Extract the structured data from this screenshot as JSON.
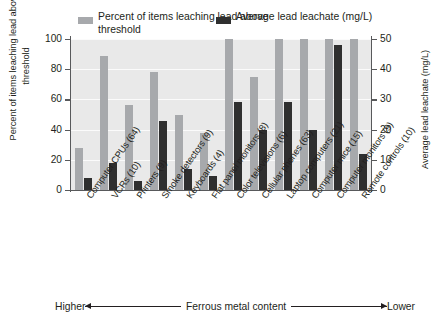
{
  "chart_data": {
    "type": "bar",
    "title": "",
    "subtitle": "",
    "xlabel": "Ferrous metal content",
    "ylabel": "Percent of items leaching lead above threshold",
    "ylabel_secondary": "Average lead leachate (mg/L)",
    "grid": true,
    "legend_position": "top",
    "ylim": [
      0,
      100
    ],
    "ylim_secondary": [
      0,
      50
    ],
    "yticks": [
      0,
      20,
      40,
      60,
      80,
      100
    ],
    "yticks_secondary": [
      0,
      10,
      20,
      30,
      40,
      50
    ],
    "categories": [
      "Computer CPUs (64)",
      "VCRs (10)",
      "Printers (9)",
      "Smoke detectors (9)",
      "Keyboards (4)",
      "Flat panel monitors (8)",
      "Color televisions (6)",
      "Cellular phones (63)",
      "Laptop computers (21)",
      "Computer mice (15)",
      "Computer monitors (9)",
      "Remote controls (10)"
    ],
    "series": [
      {
        "name": "Percent of items leaching lead above threshold",
        "axis": "left",
        "unit": "%",
        "color": "#a7a9ac",
        "values": [
          28,
          89,
          56,
          78,
          50,
          38,
          100,
          75,
          100,
          100,
          100,
          100
        ]
      },
      {
        "name": "Average lead leachate (mg/L)",
        "axis": "right",
        "unit": "mg/L",
        "color": "#2f2f2f",
        "values": [
          4,
          9,
          3,
          23,
          7,
          4.5,
          29,
          20,
          29,
          20,
          48,
          12
        ]
      }
    ],
    "annotations": {
      "axis_direction_left": "Higher",
      "axis_direction_right": "Lower",
      "axis_direction_label": "Ferrous metal content"
    }
  },
  "legend": {
    "entries": [
      {
        "label": "Percent of items leaching lead above threshold",
        "color": "#a7a9ac"
      },
      {
        "label": "Average lead leachate (mg/L)",
        "color": "#2f2f2f"
      }
    ]
  },
  "axes": {
    "left_title": "Percent of items leaching lead above threshold",
    "right_title": "Average lead leachate (mg/L)",
    "left_ticks": [
      "100",
      "80",
      "60",
      "40",
      "20",
      "0"
    ],
    "right_ticks": [
      "50",
      "40",
      "30",
      "20",
      "10",
      "0"
    ]
  },
  "footer": {
    "left_word": "Higher",
    "center_label": "Ferrous metal content",
    "right_word": "Lower"
  }
}
